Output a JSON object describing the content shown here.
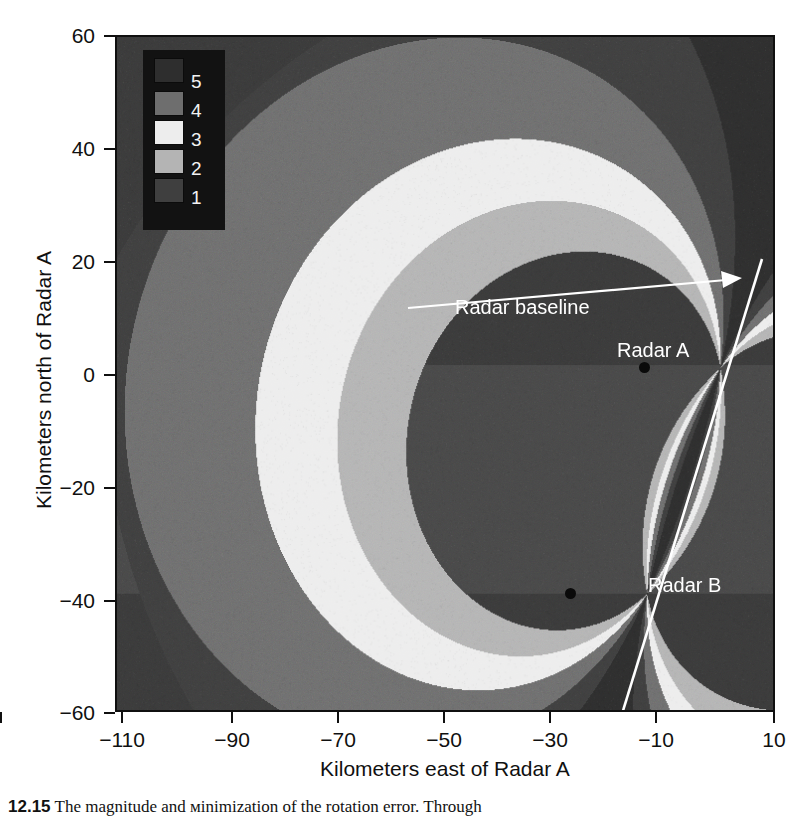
{
  "chart_data": {
    "type": "heatmap",
    "title": "",
    "xlabel": "Kilometers east of Radar A",
    "ylabel": "Kilometers north of Radar A",
    "xlim": [
      -115,
      10
    ],
    "ylim": [
      -62,
      60
    ],
    "xticks": [
      -110,
      -90,
      -70,
      -50,
      -30,
      -10,
      10
    ],
    "yticks": [
      60,
      40,
      20,
      0,
      -20,
      -40,
      -60
    ],
    "grid": false,
    "legend_position": "top-left-inset",
    "legend_title": "",
    "levels": [
      {
        "label": "5",
        "color": "#2e2e2e"
      },
      {
        "label": "4",
        "color": "#6e6e6e"
      },
      {
        "label": "3",
        "color": "#ededed"
      },
      {
        "label": "2",
        "color": "#b4b4b4"
      },
      {
        "label": "1",
        "color": "#3f3f3f"
      }
    ],
    "annotations": [
      {
        "name": "radar-baseline",
        "text": "Radar baseline",
        "x": -22,
        "y": 14,
        "arrow_to_x": 2,
        "arrow_to_y": 26
      },
      {
        "name": "radar-a",
        "text": "Radar A",
        "x": -8,
        "y": 3
      },
      {
        "name": "radar-b",
        "text": "Radar B",
        "x": -8,
        "y": -41
      }
    ],
    "markers": [
      {
        "name": "radar-a-site",
        "x": 0,
        "y": 0
      },
      {
        "name": "radar-b-site",
        "x": -14,
        "y": -41
      }
    ],
    "baseline_line": {
      "from": [
        -19,
        -62
      ],
      "to": [
        4,
        27
      ],
      "color": "#ffffff"
    }
  },
  "axes": {
    "x_tick_labels": [
      "−110",
      "−90",
      "−70",
      "−50",
      "−30",
      "−10",
      "10"
    ],
    "y_tick_labels": [
      "60",
      "40",
      "20",
      "0",
      "−20",
      "−40",
      "−60"
    ],
    "x_title": "Kilometers east of Radar A",
    "y_title": "Kilometers north of Radar A"
  },
  "legend": {
    "labels": [
      "5",
      "4",
      "3",
      "2",
      "1"
    ],
    "swatch_colors": [
      "#2e2e2e",
      "#6e6e6e",
      "#ededed",
      "#b4b4b4",
      "#3f3f3f"
    ],
    "background": "#121212"
  },
  "annotations": {
    "baseline": "Radar baseline",
    "radar_a": "Radar A",
    "radar_b": "Radar B"
  },
  "caption": {
    "number": "12.15",
    "text": "The magnitude and міnimization of the rotation error. Through"
  },
  "colors": {
    "plot_background": "#3a3a3a",
    "frame": "#101010",
    "text": "#101010",
    "annotation_text": "#ffffff",
    "band_dark": "#2e2e2e",
    "band_mid_dark": "#3f3f3f",
    "band_mid": "#6e6e6e",
    "band_light": "#b4b4b4",
    "band_white": "#ededed"
  }
}
